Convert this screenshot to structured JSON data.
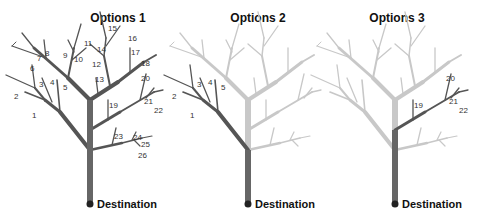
{
  "panels": [
    {
      "title": "Options 1",
      "destination": "Destination",
      "highlighted": "all"
    },
    {
      "title": "Options 2",
      "destination": "Destination",
      "highlighted": "left-branch"
    },
    {
      "title": "Options 3",
      "destination": "Destination",
      "highlighted": "right-lower-branch"
    }
  ],
  "labels": {
    "p1": [
      "1",
      "2",
      "3",
      "4",
      "5",
      "6",
      "7",
      "8",
      "9",
      "10",
      "11",
      "12",
      "13",
      "14",
      "15",
      "16",
      "17",
      "18",
      "19",
      "20",
      "21",
      "22",
      "23",
      "24",
      "25",
      "26"
    ],
    "p2": [
      "1",
      "2",
      "3",
      "4",
      "5"
    ],
    "p3": [
      "19",
      "20",
      "21",
      "22"
    ]
  },
  "colors": {
    "active": "#555555",
    "active_trunk": "#666666",
    "inactive": "#c8c8c8",
    "text": "#222222"
  }
}
